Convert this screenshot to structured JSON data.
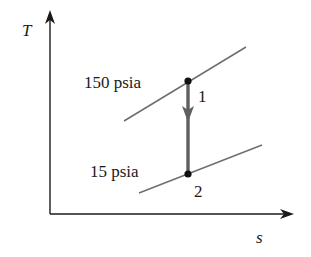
{
  "diagram": {
    "type": "T-s diagram",
    "axes": {
      "y_label": "T",
      "x_label": "s"
    },
    "isobars": [
      {
        "label": "150 psia"
      },
      {
        "label": "15 psia"
      }
    ],
    "states": [
      {
        "label": "1"
      },
      {
        "label": "2"
      }
    ],
    "process": {
      "from": "1",
      "to": "2",
      "direction": "down"
    },
    "colors": {
      "axis": "#1a1a1a",
      "isobar": "#6e6e6e",
      "process": "#5f5f5f",
      "point": "#111111"
    }
  }
}
